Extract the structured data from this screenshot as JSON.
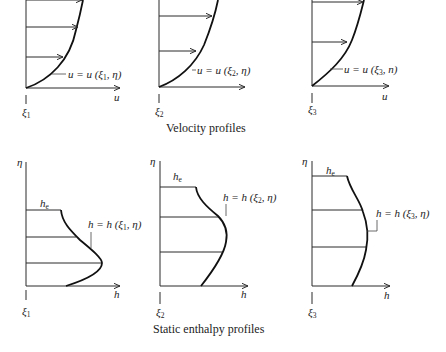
{
  "figure": {
    "velocity_row": {
      "caption": "Velocity profiles",
      "panels": [
        {
          "station": "ξ",
          "station_sub": "1",
          "x_axis": "u",
          "curve_label": "u = u (ξ",
          "curve_label_sub": "1",
          "curve_label_tail": ", η)"
        },
        {
          "station": "ξ",
          "station_sub": "2",
          "x_axis": "",
          "curve_label": "u = u (ξ",
          "curve_label_sub": "2",
          "curve_label_tail": ", η)"
        },
        {
          "station": "ξ",
          "station_sub": "3",
          "x_axis": "u",
          "curve_label": "u = u (ξ",
          "curve_label_sub": "3",
          "curve_label_tail": ", n)"
        }
      ]
    },
    "enthalpy_row": {
      "caption": "Static enthalpy profiles",
      "panels": [
        {
          "y_axis": "η",
          "edge": "h",
          "edge_sub": "e",
          "station": "ξ",
          "station_sub": "1",
          "x_axis": "h",
          "curve_label": "h = h (ξ",
          "curve_label_sub": "1",
          "curve_label_tail": ", η)"
        },
        {
          "y_axis": "η",
          "edge": "h",
          "edge_sub": "e",
          "station": "ξ",
          "station_sub": "2",
          "x_axis": "h",
          "curve_label": "h = h (ξ",
          "curve_label_sub": "2",
          "curve_label_tail": ", η)"
        },
        {
          "y_axis": "η",
          "edge": "h",
          "edge_sub": "e",
          "station": "ξ",
          "station_sub": "3",
          "x_axis": "h",
          "curve_label": "h = h (ξ",
          "curve_label_sub": "3",
          "curve_label_tail": ", η)"
        }
      ]
    }
  }
}
